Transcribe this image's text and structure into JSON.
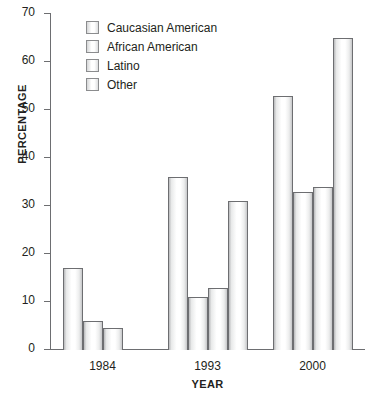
{
  "chart_data": {
    "type": "bar",
    "title": "",
    "xlabel": "YEAR",
    "ylabel": "PERCENTAGE",
    "categories": [
      "1984",
      "1993",
      "2000"
    ],
    "series": [
      {
        "name": "Caucasian American",
        "values": [
          17,
          36,
          53
        ]
      },
      {
        "name": "African American",
        "values": [
          6,
          11,
          33
        ]
      },
      {
        "name": "Latino",
        "values": [
          4.5,
          13,
          34
        ]
      },
      {
        "name": "Other",
        "values": [
          null,
          31,
          65
        ]
      }
    ],
    "ylim": [
      0,
      70
    ],
    "ytick_labels": [
      "70",
      "60",
      "50",
      "40",
      "30",
      "20",
      "10",
      "0"
    ],
    "yticks": [
      70,
      60,
      50,
      40,
      30,
      20,
      10,
      0
    ],
    "grid": false,
    "legend_position": "top-left-inside",
    "bar_fill_color": "#ffffff",
    "bar_border_color": "#6d6e71",
    "axis_color": "#6d6e71",
    "text_color": "#231f20"
  },
  "legend": {
    "items": [
      {
        "label": "Caucasian American",
        "swatch": "legend-swatch-caucasian-american"
      },
      {
        "label": "African American",
        "swatch": "legend-swatch-african-american"
      },
      {
        "label": "Latino",
        "swatch": "legend-swatch-latino"
      },
      {
        "label": "Other",
        "swatch": "legend-swatch-other"
      }
    ]
  }
}
